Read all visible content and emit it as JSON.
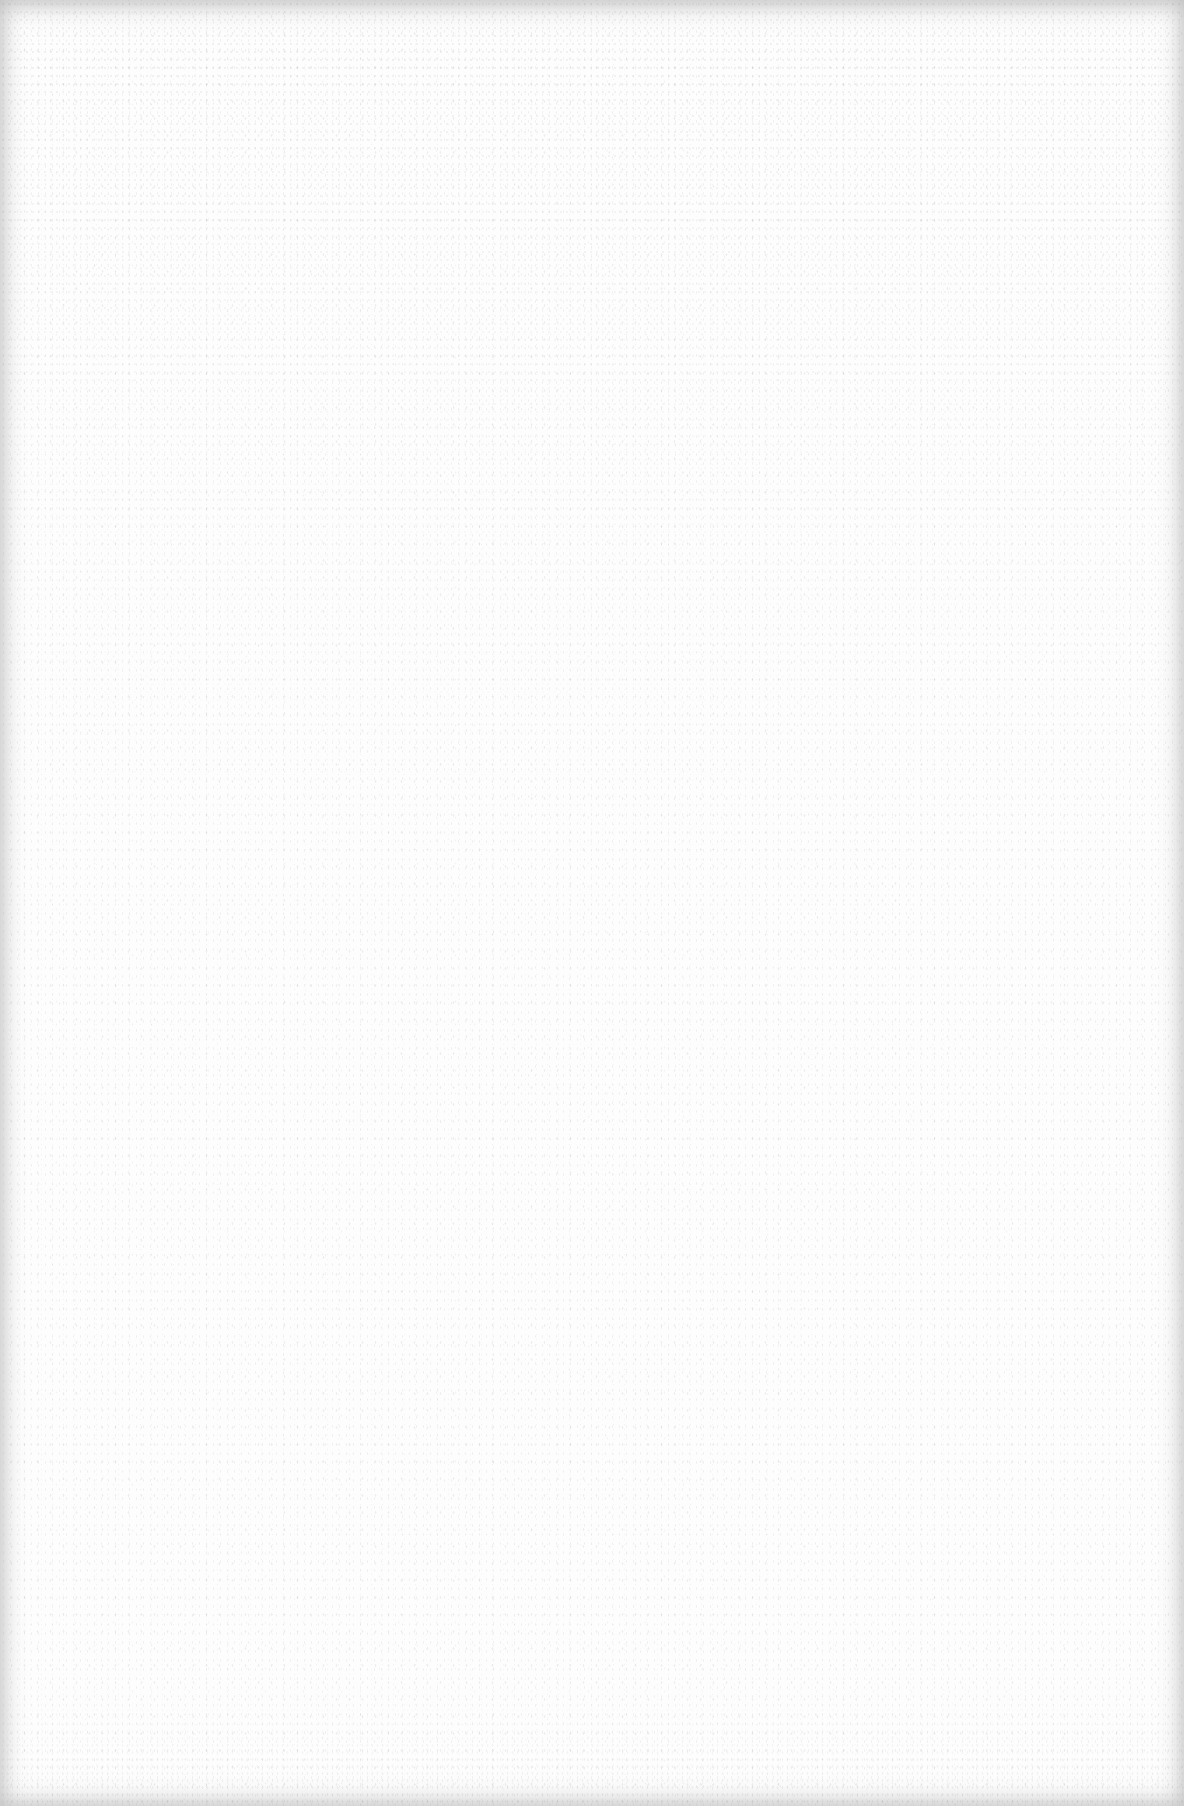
{
  "page": {
    "content_text": "",
    "background_color": "#fdfdfd",
    "speckle_color": "#8c8c8c",
    "edge_shade_color": "#a0a0a0"
  }
}
